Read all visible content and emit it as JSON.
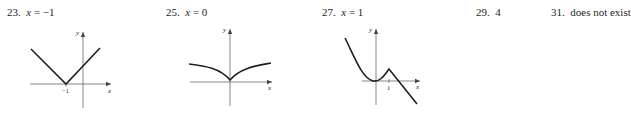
{
  "answers": [
    {
      "number": "23.",
      "variable": "x",
      "relation": " = ",
      "value": "−1"
    },
    {
      "number": "25.",
      "variable": "x",
      "relation": " = ",
      "value": "0"
    },
    {
      "number": "27.",
      "variable": "x",
      "relation": " = ",
      "value": "1"
    },
    {
      "number": "29.",
      "text": "4"
    },
    {
      "number": "31.",
      "text": "does not exist"
    }
  ],
  "graphs": [
    {
      "y_label": "y",
      "x_label": "x",
      "tick_label": "−1",
      "description": "V-shaped absolute value graph with vertex at x = -1"
    },
    {
      "y_label": "y",
      "x_label": "x",
      "description": "cusp curve with minimum cusp at origin"
    },
    {
      "y_label": "y",
      "x_label": "x",
      "tick_label": "1",
      "description": "parabola to local min at 0, rising to corner at x = 1, then decreasing line"
    }
  ],
  "colors": {
    "ink": "#231f20",
    "axis": "#555555"
  }
}
